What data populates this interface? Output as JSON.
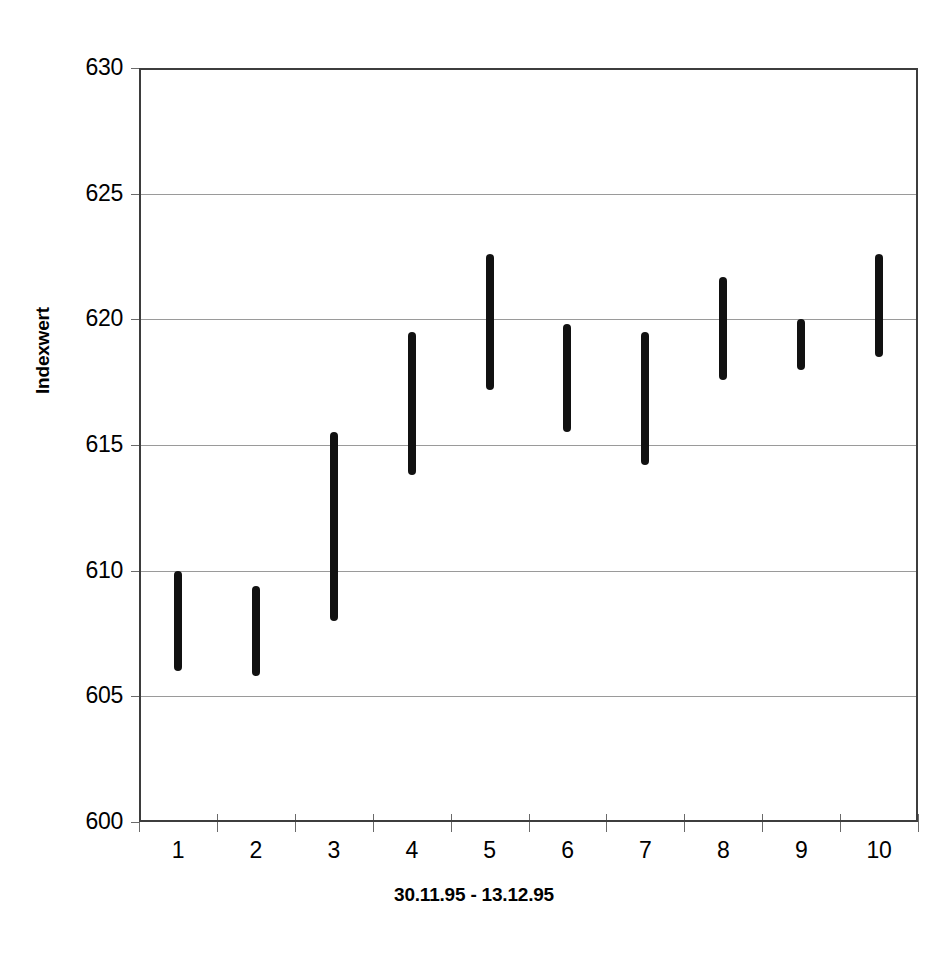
{
  "chart_data": {
    "type": "bar",
    "subtype": "high-low-range",
    "title": "",
    "xlabel": "30.11.95 - 13.12.95",
    "ylabel": "Indexwert",
    "categories": [
      "1",
      "2",
      "3",
      "4",
      "5",
      "6",
      "7",
      "8",
      "9",
      "10"
    ],
    "ylim": [
      600,
      630
    ],
    "ytick_labels": [
      "630",
      "625",
      "620",
      "615",
      "610",
      "605",
      "600"
    ],
    "ytick_values": [
      630,
      625,
      620,
      615,
      610,
      605,
      600
    ],
    "ytick_step": 5,
    "grid": true,
    "legend": false,
    "bar_color": "#111111",
    "gridline_color": "#9a9a9a",
    "frame_color": "#3d3d3d",
    "series": [
      {
        "name": "high",
        "values": [
          610.0,
          609.4,
          615.5,
          619.5,
          622.6,
          619.8,
          619.5,
          621.7,
          620.0,
          622.6
        ]
      },
      {
        "name": "low",
        "values": [
          606.0,
          605.8,
          608.0,
          613.8,
          617.2,
          615.5,
          614.2,
          617.6,
          618.0,
          618.5
        ]
      }
    ],
    "points": [
      {
        "category": "1",
        "high": 610.0,
        "low": 606.0
      },
      {
        "category": "2",
        "high": 609.4,
        "low": 605.8
      },
      {
        "category": "3",
        "high": 615.5,
        "low": 608.0
      },
      {
        "category": "4",
        "high": 619.5,
        "low": 613.8
      },
      {
        "category": "5",
        "high": 622.6,
        "low": 617.2
      },
      {
        "category": "6",
        "high": 619.8,
        "low": 615.5
      },
      {
        "category": "7",
        "high": 619.5,
        "low": 614.2
      },
      {
        "category": "8",
        "high": 621.7,
        "low": 617.6
      },
      {
        "category": "9",
        "high": 620.0,
        "low": 618.0
      },
      {
        "category": "10",
        "high": 622.6,
        "low": 618.5
      }
    ]
  }
}
